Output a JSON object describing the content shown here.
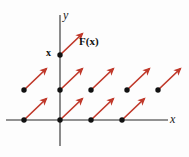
{
  "figure": {
    "title": "",
    "type": "vector-field-diagram",
    "background_color": "#fdfdfd",
    "axis_color": "#6e6e6e",
    "dot_color": "#111111",
    "arrow_color": "#c0392b"
  },
  "axes": {
    "y_label": "y",
    "x_label": "x",
    "x_axis": {
      "y": 120,
      "x_start": 6,
      "x_end": 168
    },
    "y_axis": {
      "x": 60,
      "y_start": 15,
      "y_end": 146
    }
  },
  "annotations": {
    "point_label": "x",
    "field_label": "F(x)",
    "field_label_prefix": "F(",
    "field_label_arg": "x",
    "field_label_suffix": ")"
  },
  "chart_data": {
    "type": "scatter",
    "title": "",
    "xlabel": "x",
    "ylabel": "y",
    "grid": false,
    "legend": null,
    "arrow_vector": {
      "dx": 22,
      "dy": -21
    },
    "rows": [
      {
        "name": "top-row",
        "points": [
          {
            "x": 60,
            "y": 55,
            "labeled": true,
            "label": "x"
          }
        ]
      },
      {
        "name": "middle-row",
        "points": [
          {
            "x": 24,
            "y": 90,
            "labeled": false
          },
          {
            "x": 60,
            "y": 90,
            "labeled": false
          },
          {
            "x": 91,
            "y": 90,
            "labeled": false
          },
          {
            "x": 127,
            "y": 90,
            "labeled": false
          },
          {
            "x": 158,
            "y": 90,
            "labeled": false
          }
        ]
      },
      {
        "name": "bottom-row",
        "points": [
          {
            "x": 24,
            "y": 120,
            "labeled": false
          },
          {
            "x": 60,
            "y": 120,
            "labeled": false
          },
          {
            "x": 91,
            "y": 120,
            "labeled": false
          },
          {
            "x": 122,
            "y": 120,
            "labeled": false
          }
        ]
      }
    ]
  }
}
